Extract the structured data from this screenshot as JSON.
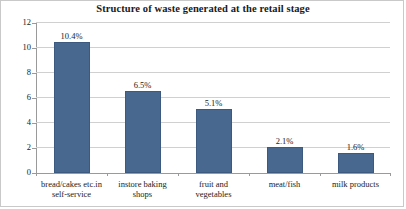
{
  "chart_data": {
    "type": "bar",
    "title": "Structure of waste generated at the retail stage",
    "xlabel": "",
    "ylabel": "",
    "ylim": [
      0,
      12
    ],
    "ytick_labels": [
      "0",
      "2",
      "4",
      "6",
      "8",
      "10",
      "12"
    ],
    "ytick_values": [
      0,
      2,
      4,
      6,
      8,
      10,
      12
    ],
    "grid": true,
    "legend": "none",
    "bar_color": "#48688f",
    "gridline_color": "#d0d0d0",
    "axis_color": "#9a9a9a",
    "categories": [
      "bread/cakes etc.in self-service",
      "instore baking shops",
      "fruit and vegetables",
      "meat/fish",
      "milk products"
    ],
    "category_lines": [
      [
        "bread/cakes etc.in",
        "self-service"
      ],
      [
        "instore baking",
        "shops"
      ],
      [
        "fruit and",
        "vegetables"
      ],
      [
        "meat/fish"
      ],
      [
        "milk products"
      ]
    ],
    "values": [
      10.4,
      6.5,
      5.1,
      2.1,
      1.6
    ],
    "data_labels": [
      "10.4%",
      "6.5%",
      "5.1%",
      "2.1%",
      "1.6%"
    ]
  }
}
